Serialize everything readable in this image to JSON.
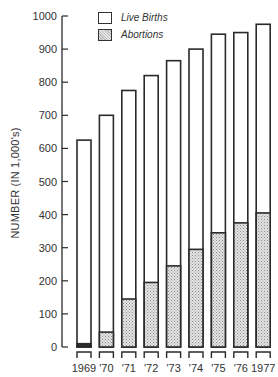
{
  "chart_data": {
    "type": "bar",
    "title": "",
    "xlabel": "",
    "ylabel": "NUMBER (IN 1,000's)",
    "ylim": [
      0,
      1000
    ],
    "yticks": [
      0,
      100,
      200,
      300,
      400,
      500,
      600,
      700,
      800,
      900,
      1000
    ],
    "grid": false,
    "legend_position": "top-left (inside plot)",
    "categories": [
      "1969",
      "'70",
      "'71",
      "'72",
      "'73",
      "'74",
      "'75",
      "'76",
      "1977"
    ],
    "series": [
      {
        "name": "Live Births",
        "fill": "white",
        "values": [
          625,
          700,
          775,
          820,
          865,
          900,
          945,
          950,
          975
        ]
      },
      {
        "name": "Abortions",
        "fill": "stippled gray",
        "values": [
          10,
          45,
          145,
          195,
          245,
          295,
          345,
          375,
          405
        ]
      }
    ],
    "layout": "overlapping bars (abortions drawn inside live-birth bars from baseline)"
  },
  "legend": {
    "live_births": "Live Births",
    "abortions": "Abortions"
  },
  "axis": {
    "ylabel": "NUMBER (IN 1,000's)"
  },
  "colors": {
    "outline": "#2a2a2a",
    "stipple": "#c8c8c8"
  }
}
